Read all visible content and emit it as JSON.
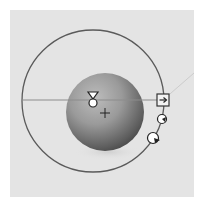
{
  "viewport": {
    "background": "#e4e4e4",
    "border_color": "#ffffff"
  },
  "gizmo": {
    "type": "light-rotation-gizmo",
    "orbit_circle": {
      "cx": 93,
      "cy": 101,
      "r": 71,
      "stroke": "#5a5a5a"
    },
    "horizon_line": {
      "x1": 22,
      "y1": 100,
      "x2": 163,
      "y2": 100,
      "stroke": "#8a8a8a"
    },
    "direction_line": {
      "x1": 163,
      "y1": 100,
      "x2": 202,
      "y2": 72,
      "stroke": "#c8c8c8"
    },
    "sphere": {
      "cx": 105,
      "cy": 112,
      "r": 39,
      "highlight": "#b8b8b8",
      "shadow": "#4a4a4a"
    },
    "center_marker": {
      "icon": "crosshair-icon",
      "x": 105,
      "y": 113
    },
    "light_marker": {
      "icon": "light-source-icon",
      "x": 93,
      "y": 100
    },
    "handles": [
      {
        "name": "direction-handle",
        "icon": "arrow-right-box-icon",
        "x": 163,
        "y": 100
      },
      {
        "name": "rotation-handle-small",
        "icon": "rotate-knob-icon",
        "x": 162,
        "y": 119
      },
      {
        "name": "rotation-handle-large",
        "icon": "rotate-knob-icon",
        "x": 154,
        "y": 138
      }
    ]
  }
}
